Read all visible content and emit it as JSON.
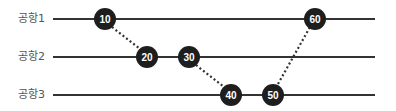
{
  "lanes": [
    {
      "label": "공항1",
      "y": 19
    },
    {
      "label": "공항2",
      "y": 57
    },
    {
      "label": "공항3",
      "y": 95
    }
  ],
  "line": {
    "x_start": 53,
    "x_end": 375,
    "color": "#333333"
  },
  "nodes": [
    {
      "label": "10",
      "x": 105,
      "lane": 0
    },
    {
      "label": "20",
      "x": 147,
      "lane": 1
    },
    {
      "label": "30",
      "x": 189,
      "lane": 1
    },
    {
      "label": "40",
      "x": 231,
      "lane": 2
    },
    {
      "label": "50",
      "x": 273,
      "lane": 2
    },
    {
      "label": "60",
      "x": 315,
      "lane": 0
    }
  ],
  "connectors": [
    {
      "from": "10",
      "to": "20",
      "style": "dotted"
    },
    {
      "from": "30",
      "to": "40",
      "style": "dotted"
    },
    {
      "from": "50",
      "to": "60",
      "style": "dotted"
    }
  ],
  "colors": {
    "node_fill": "#1e1e1e",
    "node_text": "#ffffff",
    "label_text": "#555555"
  }
}
